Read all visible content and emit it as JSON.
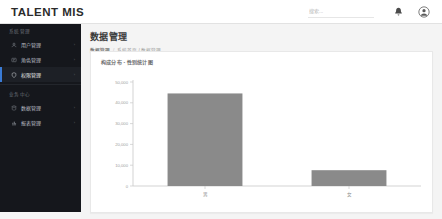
{
  "topbar": {
    "brand": "TALENT MIS",
    "search_placeholder": "搜索...",
    "search_value": "",
    "bell_icon": "bell-icon",
    "avatar_icon": "user-avatar-icon"
  },
  "sidebar": {
    "sections": [
      {
        "title": "系统管理",
        "items": [
          {
            "label": "用户管理",
            "icon": "user-icon",
            "caret": "›",
            "active": false
          },
          {
            "label": "角色管理",
            "icon": "role-icon",
            "caret": "›",
            "active": false
          },
          {
            "label": "权限管理",
            "icon": "shield-icon",
            "caret": "›",
            "active": true
          }
        ]
      },
      {
        "title": "业务中心",
        "items": [
          {
            "label": "数据管理",
            "icon": "database-icon",
            "caret": "›",
            "active": false
          },
          {
            "label": "报表管理",
            "icon": "chart-icon",
            "caret": "›",
            "active": false
          }
        ]
      }
    ]
  },
  "main": {
    "page_title": "数据管理",
    "breadcrumb": {
      "current": "数据管理",
      "separator": "/",
      "trail": "系统首页 / 数据管理"
    }
  },
  "chart_data": {
    "type": "bar",
    "title": "构成分布 - 性别统计图",
    "categories": [
      "男",
      "女"
    ],
    "values": [
      44500,
      7600
    ],
    "xlabel": "",
    "ylabel": "",
    "ylim": [
      0,
      50000
    ],
    "yticks": [
      0,
      10000,
      20000,
      30000,
      40000,
      50000
    ],
    "ytick_labels": [
      "0",
      "10,000",
      "20,000",
      "30,000",
      "40,000",
      "50,000"
    ],
    "grid": false,
    "legend": false,
    "bar_color": "#8a8a8a",
    "axis_color": "#c8c8c8",
    "tick_text_color": "#a0a0a0"
  }
}
